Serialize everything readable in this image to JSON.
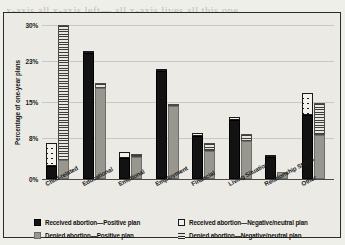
{
  "background_page_text": "x-axis all x-axis left— all x-axis lives all this one\n\nthe gap and making impact it should be made she\n\nmore than less. Really all the reports her and one wom\n\nto be made to the someone such as with a\n\n",
  "chart_data": {
    "type": "bar",
    "subtype": "grouped-stacked",
    "title": "",
    "xlabel": "",
    "ylabel": "Percentage of one-year plans",
    "ylim": [
      0,
      30
    ],
    "ytick_labels": [
      "0%",
      "8%",
      "15%",
      "23%",
      "30%"
    ],
    "ytick_values": [
      0,
      8,
      15,
      23,
      30
    ],
    "grid": true,
    "legend_position": "bottom",
    "categories": [
      "Child-related",
      "Educational",
      "Emotional",
      "Employment",
      "Financial",
      "Living Situation",
      "Relationship Status",
      "Other"
    ],
    "series": [
      {
        "name": "Received abortion—Positive plan",
        "key": "received_positive",
        "style": "black",
        "stack": "received",
        "values": [
          2.5,
          24.5,
          4.0,
          21.0,
          8.3,
          11.5,
          4.3,
          12.5
        ]
      },
      {
        "name": "Received abortion—Negative/neutral plan",
        "key": "received_negative",
        "style": "cross",
        "stack": "received",
        "values": [
          4.5,
          0.4,
          1.2,
          0.3,
          0.7,
          0.6,
          0.4,
          4.3
        ]
      },
      {
        "name": "Denied abortion—Positive plan",
        "key": "denied_positive",
        "style": "gray",
        "stack": "denied",
        "values": [
          3.7,
          17.8,
          4.3,
          14.3,
          5.4,
          7.4,
          1.4,
          8.5
        ]
      },
      {
        "name": "Denied abortion—Negative/neutral plan",
        "key": "denied_negative",
        "style": "hatch",
        "stack": "denied",
        "values": [
          26.3,
          0.9,
          0.6,
          0.4,
          1.7,
          1.4,
          0.0,
          6.3
        ]
      }
    ],
    "stack_totals": {
      "received": [
        7.0,
        24.9,
        5.2,
        21.3,
        9.0,
        12.1,
        4.7,
        16.8
      ],
      "denied": [
        30.0,
        18.7,
        4.9,
        14.7,
        7.1,
        8.8,
        1.4,
        14.8
      ]
    }
  },
  "legend": {
    "items": [
      {
        "label": "Received abortion—Positive plan",
        "style": "black"
      },
      {
        "label": "Received abortion—Negative/neutral plan",
        "style": "cross"
      },
      {
        "label": "Denied abortion—Positive plan",
        "style": "gray"
      },
      {
        "label": "Denied abortion—Negative/neutral plan",
        "style": "hatch"
      }
    ]
  },
  "colors": {
    "positive_received": "#121212",
    "positive_denied": "#97968f",
    "negative_received": "#1a1a1a",
    "negative_denied": "#3d3d39",
    "plot_background": "#eceae4",
    "page_background": "#efefea",
    "frame": "#2b2b2b"
  }
}
